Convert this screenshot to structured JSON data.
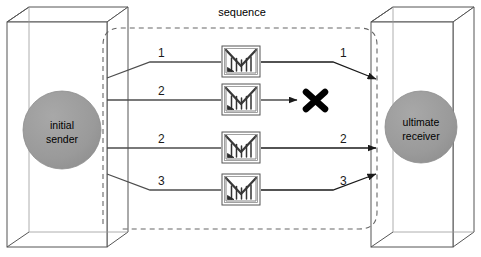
{
  "figure": {
    "title": "",
    "type": "network-sequence-diagram",
    "background": "#ffffff"
  },
  "colors": {
    "node_fill": "#999999",
    "node_stroke": "#8c8c8c",
    "box_stroke": "#555555",
    "line": "#4d4d4d",
    "dashed_boundary": "#666666",
    "envelope_fill": "#ffffff",
    "envelope_stroke": "#555555",
    "envelope_detail": "#333333",
    "drop_mark": "#000000",
    "text": "#000000"
  },
  "boundary": {
    "label": "sequence",
    "style": "dashed-rounded"
  },
  "endpoints": {
    "sender": {
      "label_line1": "initial",
      "label_line2": "sender",
      "shape": "circle"
    },
    "receiver": {
      "label_line1": "ultimate",
      "label_line2": "receiver",
      "shape": "circle"
    }
  },
  "packets": [
    {
      "id": "packet-1",
      "sent_label": "1",
      "received_label": "1",
      "icon": "envelope-icon",
      "delivered": true,
      "y": 62
    },
    {
      "id": "packet-2",
      "sent_label": "2",
      "received_label": "",
      "icon": "envelope-icon",
      "delivered": false,
      "drop_marker": "x-mark-icon",
      "y": 100
    },
    {
      "id": "packet-3",
      "sent_label": "2",
      "received_label": "2",
      "icon": "envelope-icon",
      "delivered": true,
      "y": 148
    },
    {
      "id": "packet-4",
      "sent_label": "3",
      "received_label": "3",
      "icon": "envelope-icon",
      "delivered": true,
      "y": 190
    }
  ]
}
